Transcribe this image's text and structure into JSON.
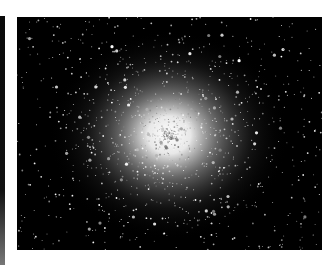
{
  "image": {
    "subject": "globular star cluster",
    "alt": "Dense globular star cluster with bright white core on black sky",
    "background_color": "#ffffff",
    "sky_color": "#000000",
    "core_color": "#ffffff"
  }
}
